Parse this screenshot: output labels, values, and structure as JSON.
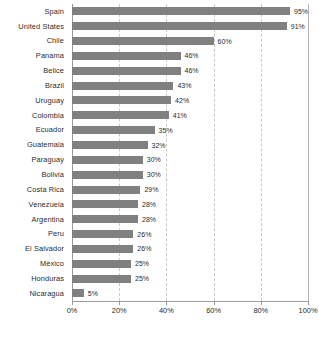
{
  "chart_data": {
    "type": "bar",
    "orientation": "horizontal",
    "title": "",
    "subtitle": "",
    "xlabel": "",
    "ylabel": "",
    "xlim": [
      0,
      100
    ],
    "grid": true,
    "legend": false,
    "legend_position": "none",
    "bar_color": "#808080",
    "gridline_color": "#c8c8c8",
    "axis_color": "#9a9a9a",
    "text_color": "#2b2b2b",
    "xticks": [
      0,
      20,
      40,
      60,
      80,
      100
    ],
    "xtick_labels": [
      "0%",
      "20%",
      "40%",
      "60%",
      "80%",
      "100%"
    ],
    "categories": [
      "Spain",
      "United States",
      "Chile",
      "Panama",
      "Belice",
      "Brazil",
      "Uruguay",
      "Colombia",
      "Ecuador",
      "Guatemala",
      "Paraguay",
      "Bolivia",
      "Costa Rica",
      "Venezuela",
      "Argentina",
      "Peru",
      "El Salvador",
      "México",
      "Honduras",
      "Nicaragua"
    ],
    "values": [
      95,
      91,
      60,
      46,
      46,
      43,
      42,
      41,
      35,
      32,
      30,
      30,
      29,
      28,
      28,
      26,
      26,
      25,
      25,
      5
    ],
    "value_labels": [
      "95%",
      "91%",
      "60%",
      "46%",
      "46%",
      "43%",
      "42%",
      "41%",
      "35%",
      "32%",
      "30%",
      "30%",
      "29%",
      "28%",
      "28%",
      "26%",
      "26%",
      "25%",
      "25%",
      "5%"
    ]
  }
}
